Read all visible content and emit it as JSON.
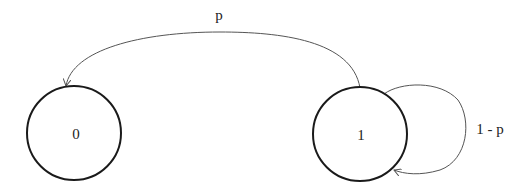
{
  "diagram": {
    "type": "state-transition",
    "states": [
      {
        "id": "state-0",
        "label": "0"
      },
      {
        "id": "state-1",
        "label": "1"
      }
    ],
    "transitions": [
      {
        "from": "1",
        "to": "0",
        "label": "p"
      },
      {
        "from": "1",
        "to": "1",
        "label": "1 - p"
      }
    ]
  },
  "colors": {
    "stroke": "#1a1a1a",
    "edge": "#555555",
    "background": "#ffffff"
  }
}
